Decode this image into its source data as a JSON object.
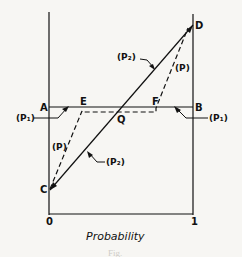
{
  "figure": {
    "points": {
      "A": "A",
      "B": "B",
      "C": "C",
      "D": "D",
      "E": "E",
      "F": "F",
      "Q": "Q"
    },
    "curve_labels": {
      "p1_left": "(P₁)",
      "p1_right": "(P₁)",
      "p2_upper": "(P₂)",
      "p2_lower": "(P₂)",
      "p_upper": "(P)",
      "p_lower": "(P)"
    },
    "axis": {
      "x_min_label": "0",
      "x_max_label": "1",
      "x_title": "Probability"
    },
    "caption": "Fig."
  }
}
